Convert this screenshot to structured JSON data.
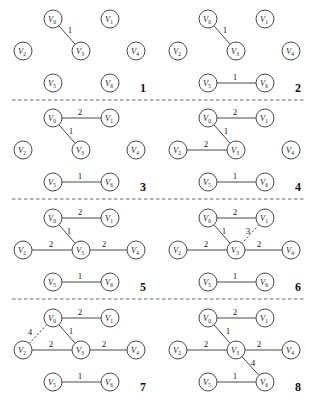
{
  "figure": {
    "node_radius": 9,
    "nodes": [
      {
        "id": "V0",
        "label": "V",
        "sub": "0",
        "x": 53,
        "y": 19
      },
      {
        "id": "V1",
        "label": "V",
        "sub": "1",
        "x": 110,
        "y": 19
      },
      {
        "id": "V2",
        "label": "V",
        "sub": "2",
        "x": 23,
        "y": 51
      },
      {
        "id": "V3",
        "label": "V",
        "sub": "3",
        "x": 81,
        "y": 51
      },
      {
        "id": "V4",
        "label": "V",
        "sub": "4",
        "x": 136,
        "y": 51
      },
      {
        "id": "V5",
        "label": "V",
        "sub": "5",
        "x": 53,
        "y": 83
      },
      {
        "id": "V6",
        "label": "V",
        "sub": "6",
        "x": 110,
        "y": 83
      }
    ],
    "panels": [
      {
        "step": "1",
        "ox": 0,
        "oy": 0,
        "edges": [
          {
            "from": "V0",
            "to": "V3",
            "weight": "1",
            "style": "solid",
            "lx": 70,
            "ly": 33
          }
        ]
      },
      {
        "step": "2",
        "ox": 155,
        "oy": 0,
        "edges": [
          {
            "from": "V0",
            "to": "V3",
            "weight": "1",
            "style": "solid",
            "lx": 70,
            "ly": 33
          },
          {
            "from": "V5",
            "to": "V6",
            "weight": "1",
            "style": "solid",
            "lx": 80,
            "ly": 80
          }
        ]
      },
      {
        "step": "3",
        "ox": 0,
        "oy": 99,
        "edges": [
          {
            "from": "V0",
            "to": "V1",
            "weight": "2",
            "style": "solid",
            "lx": 80,
            "ly": 16
          },
          {
            "from": "V0",
            "to": "V3",
            "weight": "1",
            "style": "solid",
            "lx": 71,
            "ly": 35
          },
          {
            "from": "V5",
            "to": "V6",
            "weight": "1",
            "style": "solid",
            "lx": 80,
            "ly": 80
          }
        ]
      },
      {
        "step": "4",
        "ox": 155,
        "oy": 99,
        "edges": [
          {
            "from": "V0",
            "to": "V1",
            "weight": "2",
            "style": "solid",
            "lx": 80,
            "ly": 16
          },
          {
            "from": "V0",
            "to": "V3",
            "weight": "1",
            "style": "solid",
            "lx": 71,
            "ly": 35
          },
          {
            "from": "V2",
            "to": "V3",
            "weight": "2",
            "style": "solid",
            "lx": 51,
            "ly": 48
          },
          {
            "from": "V5",
            "to": "V6",
            "weight": "1",
            "style": "solid",
            "lx": 80,
            "ly": 80
          }
        ]
      },
      {
        "step": "5",
        "ox": 0,
        "oy": 199,
        "edges": [
          {
            "from": "V0",
            "to": "V1",
            "weight": "2",
            "style": "solid",
            "lx": 80,
            "ly": 16
          },
          {
            "from": "V0",
            "to": "V3",
            "weight": "1",
            "style": "solid",
            "lx": 69,
            "ly": 35
          },
          {
            "from": "V2",
            "to": "V3",
            "weight": "2",
            "style": "solid",
            "lx": 51,
            "ly": 48
          },
          {
            "from": "V3",
            "to": "V4",
            "weight": "2",
            "style": "solid",
            "lx": 104,
            "ly": 48
          },
          {
            "from": "V5",
            "to": "V6",
            "weight": "1",
            "style": "solid",
            "lx": 80,
            "ly": 80
          }
        ]
      },
      {
        "step": "6",
        "ox": 155,
        "oy": 199,
        "edges": [
          {
            "from": "V0",
            "to": "V1",
            "weight": "2",
            "style": "solid",
            "lx": 80,
            "ly": 16
          },
          {
            "from": "V0",
            "to": "V3",
            "weight": "1",
            "style": "solid",
            "lx": 69,
            "ly": 35
          },
          {
            "from": "V1",
            "to": "V3",
            "weight": "3",
            "style": "dashed",
            "lx": 93,
            "ly": 35
          },
          {
            "from": "V2",
            "to": "V3",
            "weight": "2",
            "style": "solid",
            "lx": 51,
            "ly": 48
          },
          {
            "from": "V3",
            "to": "V4",
            "weight": "2",
            "style": "solid",
            "lx": 104,
            "ly": 48
          },
          {
            "from": "V5",
            "to": "V6",
            "weight": "1",
            "style": "solid",
            "lx": 80,
            "ly": 80
          }
        ]
      },
      {
        "step": "7",
        "ox": 0,
        "oy": 299,
        "edges": [
          {
            "from": "V0",
            "to": "V1",
            "weight": "2",
            "style": "solid",
            "lx": 80,
            "ly": 16
          },
          {
            "from": "V0",
            "to": "V2",
            "weight": "4",
            "style": "dashed",
            "lx": 30,
            "ly": 36
          },
          {
            "from": "V0",
            "to": "V3",
            "weight": "1",
            "style": "solid",
            "lx": 71,
            "ly": 35
          },
          {
            "from": "V2",
            "to": "V3",
            "weight": "2",
            "style": "solid",
            "lx": 51,
            "ly": 48
          },
          {
            "from": "V3",
            "to": "V4",
            "weight": "2",
            "style": "solid",
            "lx": 104,
            "ly": 48
          },
          {
            "from": "V5",
            "to": "V6",
            "weight": "1",
            "style": "solid",
            "lx": 80,
            "ly": 80
          }
        ]
      },
      {
        "step": "8",
        "ox": 155,
        "oy": 299,
        "edges": [
          {
            "from": "V0",
            "to": "V1",
            "weight": "2",
            "style": "solid",
            "lx": 80,
            "ly": 16
          },
          {
            "from": "V0",
            "to": "V3",
            "weight": "1",
            "style": "solid",
            "lx": 73,
            "ly": 35
          },
          {
            "from": "V2",
            "to": "V3",
            "weight": "2",
            "style": "solid",
            "lx": 51,
            "ly": 48
          },
          {
            "from": "V3",
            "to": "V4",
            "weight": "2",
            "style": "solid",
            "lx": 104,
            "ly": 48
          },
          {
            "from": "V3",
            "to": "V6",
            "weight": "4",
            "style": "solid",
            "lx": 98,
            "ly": 67
          },
          {
            "from": "V5",
            "to": "V6",
            "weight": "1",
            "style": "solid",
            "lx": 80,
            "ly": 80
          }
        ]
      }
    ],
    "dividers": [
      {
        "y": 100,
        "x1": 12,
        "x2": 305
      },
      {
        "y": 199,
        "x1": 12,
        "x2": 305
      },
      {
        "y": 299,
        "x1": 12,
        "x2": 305
      }
    ],
    "step_label_pos": {
      "x": 140,
      "y": 92
    }
  },
  "colors": {
    "stroke": "#333333",
    "text": "#222222",
    "background": "#ffffff"
  }
}
